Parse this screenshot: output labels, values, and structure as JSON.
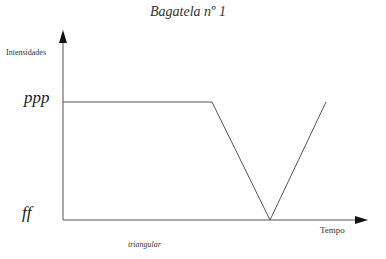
{
  "header": {
    "cut_text": "Intensidades"
  },
  "diagram": {
    "title": "Bagatela nº 1",
    "y_axis_label": "Intensidades",
    "x_axis_label": "Tempo",
    "level_high": "ppp",
    "level_low": "ff",
    "caption": "triangular",
    "line_color": "#555555",
    "shape": "plateau at ppp, linear fall to ff, linear rise back to ppp (triangular)"
  }
}
